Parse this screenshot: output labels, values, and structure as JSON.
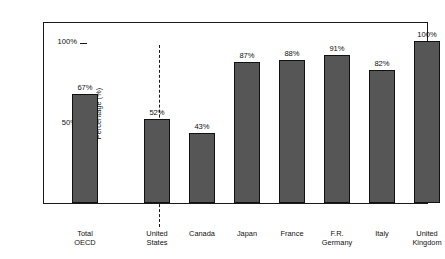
{
  "chart_data": {
    "type": "bar",
    "title": "",
    "xlabel": "",
    "ylabel": "Percentage (%)",
    "ylim": [
      0,
      112
    ],
    "grid": false,
    "legend": null,
    "ytick_labels": [
      "50%",
      "100%"
    ],
    "ytick_values": [
      50,
      100
    ],
    "categories": [
      "Total OECD",
      "United States",
      "Canada",
      "Japan",
      "France",
      "F.R. Germany",
      "Italy",
      "United Kingdom"
    ],
    "values": [
      67,
      52,
      43,
      87,
      88,
      91,
      82,
      100
    ],
    "value_labels": [
      "67%",
      "52%",
      "43%",
      "87%",
      "88%",
      "91%",
      "82%",
      "100%"
    ],
    "bar_color": "#565656",
    "bar_edge_color": "#111111",
    "annotations": [
      {
        "name": "group-divider",
        "kind": "dashed-vertical-line",
        "after_category": "Total OECD"
      }
    ]
  },
  "axis": {
    "ylabel": "Percentage (%)",
    "ticks": [
      {
        "label": "100%",
        "value": 100
      },
      {
        "label": "50%",
        "value": 50
      }
    ]
  },
  "bars": [
    {
      "label_lines": [
        "Total",
        "OECD"
      ],
      "value": 67,
      "value_label": "67%"
    },
    {
      "label_lines": [
        "United",
        "States"
      ],
      "value": 52,
      "value_label": "52%"
    },
    {
      "label_lines": [
        "Canada"
      ],
      "value": 43,
      "value_label": "43%"
    },
    {
      "label_lines": [
        "Japan"
      ],
      "value": 87,
      "value_label": "87%"
    },
    {
      "label_lines": [
        "France"
      ],
      "value": 88,
      "value_label": "88%"
    },
    {
      "label_lines": [
        "F.R.",
        "Germany"
      ],
      "value": 91,
      "value_label": "91%"
    },
    {
      "label_lines": [
        "Italy"
      ],
      "value": 82,
      "value_label": "82%"
    },
    {
      "label_lines": [
        "United",
        "Kingdom"
      ],
      "value": 100,
      "value_label": "100%"
    }
  ]
}
